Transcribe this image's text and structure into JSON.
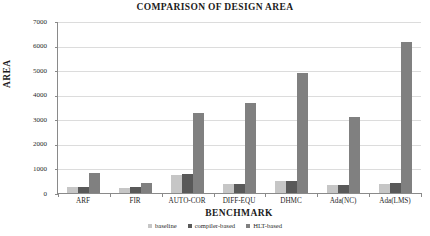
{
  "chart_data": {
    "type": "bar",
    "title": "COMPARISON OF DESIGN AREA",
    "xlabel": "BENCHMARK",
    "ylabel": "AREA",
    "ylim": [
      0,
      7000
    ],
    "yticks": [
      0,
      1000,
      2000,
      3000,
      4000,
      5000,
      6000,
      7000
    ],
    "ytick_labels": [
      "0",
      "1000",
      "2000",
      "3000",
      "4000",
      "5000",
      "6000",
      "7000"
    ],
    "grid": true,
    "legend_position": "bottom",
    "categories": [
      "ARF",
      "FIR",
      "AUTO-COR",
      "DIFF-EQU",
      "DHMC",
      "Ada(NC)",
      "Ada(LMS)"
    ],
    "series": [
      {
        "name": "baseline",
        "color": "#c6c6c6",
        "values": [
          250,
          210,
          750,
          350,
          480,
          320,
          360
        ]
      },
      {
        "name": "compiler-based",
        "color": "#595959",
        "values": [
          260,
          230,
          780,
          370,
          490,
          340,
          390
        ]
      },
      {
        "name": "HLT-based",
        "color": "#808080",
        "values": [
          800,
          420,
          3250,
          3650,
          4900,
          3100,
          6150
        ]
      }
    ]
  },
  "legend": {
    "items": [
      {
        "label": "baseline",
        "color": "#c6c6c6"
      },
      {
        "label": "compiler-based",
        "color": "#595959"
      },
      {
        "label": "HLT-based",
        "color": "#808080"
      }
    ]
  }
}
